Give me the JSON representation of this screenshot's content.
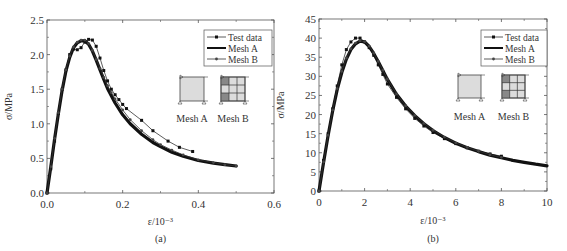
{
  "chart_data": [
    {
      "panel": "(a)",
      "type": "line",
      "xlabel": "ε/10⁻³",
      "ylabel": "σ/MPa",
      "xlim": [
        0,
        0.6
      ],
      "ylim": [
        0,
        2.5
      ],
      "xticks": [
        "0.0",
        "0.2",
        "0.4",
        "0.6"
      ],
      "xtick_values": [
        0,
        0.2,
        0.4,
        0.6
      ],
      "yticks": [
        "0.0",
        "0.5",
        "1.0",
        "1.5",
        "2.0",
        "2.5"
      ],
      "ytick_values": [
        0,
        0.5,
        1.0,
        1.5,
        2.0,
        2.5
      ],
      "legend": {
        "position": "upper right",
        "entries": [
          "Test data",
          "Mesh A",
          "Mesh B"
        ]
      },
      "insets": [
        "Mesh A",
        "Mesh B"
      ],
      "series": [
        {
          "name": "Test data",
          "marker": "square",
          "x": [
            0.0,
            0.01,
            0.02,
            0.03,
            0.04,
            0.05,
            0.06,
            0.07,
            0.08,
            0.09,
            0.1,
            0.11,
            0.12,
            0.13,
            0.14,
            0.15,
            0.16,
            0.17,
            0.18,
            0.19,
            0.2,
            0.21,
            0.25,
            0.28,
            0.32,
            0.35,
            0.385
          ],
          "y": [
            0.0,
            0.35,
            0.75,
            1.15,
            1.5,
            1.78,
            2.0,
            2.08,
            2.07,
            2.1,
            2.18,
            2.22,
            2.21,
            2.12,
            1.95,
            1.77,
            1.62,
            1.5,
            1.42,
            1.35,
            1.28,
            1.22,
            1.05,
            0.9,
            0.75,
            0.66,
            0.6
          ]
        },
        {
          "name": "Mesh A",
          "marker": "none",
          "x": [
            0.0,
            0.01,
            0.02,
            0.03,
            0.04,
            0.05,
            0.06,
            0.07,
            0.08,
            0.09,
            0.1,
            0.11,
            0.12,
            0.13,
            0.14,
            0.15,
            0.16,
            0.18,
            0.2,
            0.22,
            0.25,
            0.28,
            0.3,
            0.33,
            0.36,
            0.4,
            0.44,
            0.47,
            0.5
          ],
          "y": [
            0.0,
            0.38,
            0.78,
            1.15,
            1.48,
            1.76,
            1.96,
            2.1,
            2.17,
            2.2,
            2.2,
            2.15,
            2.05,
            1.92,
            1.78,
            1.64,
            1.51,
            1.3,
            1.13,
            1.0,
            0.85,
            0.73,
            0.67,
            0.59,
            0.53,
            0.47,
            0.43,
            0.41,
            0.39
          ]
        },
        {
          "name": "Mesh B",
          "marker": "circle",
          "x": [
            0.0,
            0.01,
            0.02,
            0.03,
            0.04,
            0.05,
            0.06,
            0.07,
            0.08,
            0.09,
            0.1,
            0.11,
            0.12,
            0.13,
            0.14,
            0.15,
            0.16,
            0.17,
            0.18,
            0.2,
            0.22,
            0.25,
            0.28,
            0.3,
            0.33,
            0.36,
            0.4,
            0.44,
            0.47,
            0.5
          ],
          "y": [
            0.0,
            0.38,
            0.79,
            1.16,
            1.5,
            1.78,
            1.98,
            2.11,
            2.18,
            2.21,
            2.21,
            2.16,
            2.06,
            1.93,
            1.8,
            1.67,
            1.55,
            1.45,
            1.36,
            1.2,
            1.06,
            0.9,
            0.77,
            0.7,
            0.62,
            0.55,
            0.48,
            0.44,
            0.41,
            0.39
          ]
        }
      ]
    },
    {
      "panel": "(b)",
      "type": "line",
      "xlabel": "ε/10⁻³",
      "ylabel": "σ/MPa",
      "xlim": [
        0,
        10
      ],
      "ylim": [
        0,
        45
      ],
      "xticks": [
        "0",
        "2",
        "4",
        "6",
        "8",
        "10"
      ],
      "xtick_values": [
        0,
        2,
        4,
        6,
        8,
        10
      ],
      "yticks": [
        "0",
        "5",
        "10",
        "15",
        "20",
        "25",
        "30",
        "35",
        "40",
        "45"
      ],
      "ytick_values": [
        0,
        5,
        10,
        15,
        20,
        25,
        30,
        35,
        40,
        45
      ],
      "legend": {
        "position": "upper right",
        "entries": [
          "Test data",
          "Mesh A",
          "Mesh B"
        ]
      },
      "insets": [
        "Mesh A",
        "Mesh B"
      ],
      "series": [
        {
          "name": "Test data",
          "marker": "square",
          "x": [
            0.0,
            0.2,
            0.4,
            0.6,
            0.8,
            1.0,
            1.2,
            1.4,
            1.6,
            1.8,
            2.0,
            2.2,
            2.4,
            2.6,
            2.8,
            3.0,
            3.4,
            3.8,
            4.2,
            4.6,
            5.0,
            5.5,
            6.0,
            6.5,
            7.0,
            7.5,
            8.0
          ],
          "y": [
            0.0,
            8.0,
            15.0,
            21.5,
            27.5,
            33.0,
            37.0,
            39.0,
            40.0,
            40.0,
            39.0,
            37.5,
            35.5,
            33.0,
            30.5,
            28.0,
            24.5,
            21.5,
            19.0,
            17.0,
            15.3,
            13.7,
            12.4,
            11.3,
            10.4,
            9.7,
            9.1
          ]
        },
        {
          "name": "Mesh A",
          "marker": "none",
          "x": [
            0.0,
            0.2,
            0.4,
            0.6,
            0.8,
            1.0,
            1.2,
            1.4,
            1.6,
            1.8,
            2.0,
            2.2,
            2.4,
            2.6,
            2.8,
            3.0,
            3.4,
            3.8,
            4.2,
            4.6,
            5.0,
            5.5,
            6.0,
            6.5,
            7.0,
            7.5,
            8.0,
            8.5,
            9.0,
            9.5,
            10.0
          ],
          "y": [
            0.0,
            7.5,
            14.5,
            21.0,
            26.5,
            31.0,
            34.5,
            37.0,
            38.5,
            39.2,
            39.0,
            37.8,
            36.0,
            33.8,
            31.5,
            29.2,
            25.3,
            22.2,
            19.7,
            17.6,
            15.8,
            14.0,
            12.5,
            11.3,
            10.3,
            9.4,
            8.7,
            8.0,
            7.5,
            7.0,
            6.6
          ]
        },
        {
          "name": "Mesh B",
          "marker": "circle",
          "x": [
            0.0,
            0.2,
            0.4,
            0.6,
            0.8,
            1.0,
            1.2,
            1.4,
            1.6,
            1.8,
            2.0,
            2.2,
            2.4,
            2.6,
            2.8,
            3.0,
            3.4,
            3.8,
            4.2,
            4.6,
            5.0,
            5.5,
            6.0,
            6.5,
            7.0,
            7.5,
            8.0
          ],
          "y": [
            0.0,
            7.6,
            14.6,
            21.2,
            26.8,
            31.3,
            34.8,
            37.2,
            38.7,
            39.3,
            39.1,
            37.9,
            36.1,
            33.9,
            31.6,
            29.3,
            25.4,
            22.3,
            19.8,
            17.7,
            15.9,
            14.1,
            12.6,
            11.4,
            10.4,
            9.5,
            8.8
          ]
        }
      ]
    }
  ],
  "figure": {
    "panel_a_caption": "(a)",
    "panel_b_caption": "(b)",
    "inset_label_a": "Mesh A",
    "inset_label_b": "Mesh B"
  }
}
